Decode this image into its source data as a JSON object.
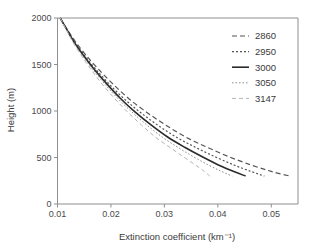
{
  "chart_data": {
    "type": "line",
    "title": "",
    "xlabel": "Extinction coefficient (km⁻¹)",
    "ylabel": "Height (m)",
    "xlim": [
      0.01,
      0.055
    ],
    "ylim": [
      0,
      2000
    ],
    "grid": false,
    "legend_position": "top-right",
    "xticks": [
      0.01,
      0.02,
      0.03,
      0.04,
      0.05
    ],
    "xtick_labels": [
      "0.01",
      "0.02",
      "0.03",
      "0.04",
      "0.05"
    ],
    "yticks": [
      0,
      500,
      1000,
      1500,
      2000
    ],
    "ytick_labels": [
      "0",
      "500",
      "1000",
      "1500",
      "2000"
    ],
    "series": [
      {
        "name": "2860",
        "style": "dashed",
        "color": "#555555",
        "width": 1.2,
        "dash": "5,3",
        "x": [
          0.0105,
          0.0118,
          0.0133,
          0.0152,
          0.0175,
          0.0202,
          0.0232,
          0.0266,
          0.0302,
          0.034,
          0.038,
          0.042,
          0.0462,
          0.05,
          0.0535
        ],
        "y": [
          2000,
          1880,
          1750,
          1610,
          1460,
          1300,
          1140,
          990,
          850,
          720,
          610,
          510,
          420,
          350,
          300
        ]
      },
      {
        "name": "2950",
        "style": "dotted-dash",
        "color": "#555555",
        "width": 1.2,
        "dash": "2,2",
        "x": [
          0.0105,
          0.0117,
          0.0131,
          0.0149,
          0.017,
          0.0195,
          0.0223,
          0.0254,
          0.0287,
          0.0322,
          0.0358,
          0.0394,
          0.043,
          0.0462,
          0.0487
        ],
        "y": [
          2000,
          1880,
          1750,
          1610,
          1460,
          1300,
          1140,
          990,
          850,
          720,
          610,
          510,
          420,
          350,
          300
        ]
      },
      {
        "name": "3000",
        "style": "solid",
        "color": "#2b2b2b",
        "width": 1.6,
        "dash": "none",
        "x": [
          0.0105,
          0.0117,
          0.013,
          0.0147,
          0.0167,
          0.0191,
          0.0217,
          0.0245,
          0.0275,
          0.0306,
          0.0338,
          0.037,
          0.0401,
          0.043,
          0.0452
        ],
        "y": [
          2000,
          1880,
          1750,
          1610,
          1460,
          1300,
          1140,
          990,
          850,
          720,
          610,
          510,
          420,
          350,
          300
        ]
      },
      {
        "name": "3050",
        "style": "fine-dotted",
        "color": "#8a8a8a",
        "width": 1.0,
        "dash": "1.5,2",
        "x": [
          0.0105,
          0.0116,
          0.0129,
          0.0145,
          0.0164,
          0.0187,
          0.0212,
          0.0239,
          0.0267,
          0.0296,
          0.0325,
          0.0354,
          0.0382,
          0.0407,
          0.0427
        ],
        "y": [
          2000,
          1880,
          1750,
          1610,
          1460,
          1300,
          1140,
          990,
          850,
          720,
          610,
          510,
          420,
          350,
          300
        ]
      },
      {
        "name": "3147",
        "style": "light-dashed",
        "color": "#b4b4b4",
        "width": 1.0,
        "dash": "4,3",
        "x": [
          0.0105,
          0.0116,
          0.0128,
          0.0143,
          0.0161,
          0.0182,
          0.0206,
          0.0231,
          0.0257,
          0.0283,
          0.031,
          0.0335,
          0.0358,
          0.0375,
          0.0385
        ],
        "y": [
          2000,
          1880,
          1750,
          1610,
          1460,
          1300,
          1140,
          990,
          850,
          720,
          610,
          510,
          420,
          350,
          300
        ]
      }
    ]
  },
  "legend": {
    "entries": [
      {
        "label": "2860"
      },
      {
        "label": "2950"
      },
      {
        "label": "3000"
      },
      {
        "label": "3050"
      },
      {
        "label": "3147"
      }
    ]
  }
}
